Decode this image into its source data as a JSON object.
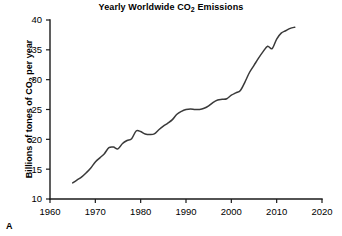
{
  "panel": {
    "label": "A"
  },
  "chart_data": {
    "type": "line",
    "title": "Yearly Worldwide CO2 Emissions",
    "title_parts": {
      "before": "Yearly Worldwide CO",
      "sub": "2",
      "after": " Emissions"
    },
    "xlabel": "",
    "ylabel": "Billions of tones of CO2 per year",
    "ylabel_parts": {
      "before": "Billions of tones of CO",
      "sub": "2",
      "after": " per year"
    },
    "xlim": [
      1960,
      2020
    ],
    "ylim": [
      10,
      40
    ],
    "xticks": [
      1960,
      1970,
      1980,
      1990,
      2000,
      2010,
      2020
    ],
    "yticks": [
      10,
      15,
      20,
      25,
      30,
      35,
      40
    ],
    "xtick_labels": [
      "1960",
      "1970",
      "1980",
      "1990",
      "2000",
      "2010",
      "2020"
    ],
    "ytick_labels": [
      "10",
      "15",
      "20",
      "25",
      "30",
      "35",
      "40"
    ],
    "grid": false,
    "legend": false,
    "line_color": "#3a3a3a",
    "series": [
      {
        "name": "Worldwide CO2 emissions",
        "x": [
          1965,
          1966,
          1967,
          1968,
          1969,
          1970,
          1971,
          1972,
          1973,
          1974,
          1975,
          1976,
          1977,
          1978,
          1979,
          1980,
          1981,
          1982,
          1983,
          1984,
          1985,
          1986,
          1987,
          1988,
          1989,
          1990,
          1991,
          1992,
          1993,
          1994,
          1995,
          1996,
          1997,
          1998,
          1999,
          2000,
          2001,
          2002,
          2003,
          2004,
          2005,
          2006,
          2007,
          2008,
          2009,
          2010,
          2011,
          2012,
          2013,
          2014
        ],
        "values": [
          12.7,
          13.2,
          13.7,
          14.4,
          15.2,
          16.2,
          16.9,
          17.6,
          18.6,
          18.7,
          18.4,
          19.3,
          19.8,
          20.1,
          21.4,
          21.3,
          20.9,
          20.8,
          20.9,
          21.6,
          22.2,
          22.7,
          23.3,
          24.2,
          24.7,
          25.0,
          25.1,
          25.0,
          25.0,
          25.2,
          25.6,
          26.2,
          26.6,
          26.7,
          26.8,
          27.4,
          27.8,
          28.2,
          29.6,
          31.2,
          32.4,
          33.6,
          34.7,
          35.6,
          35.2,
          36.8,
          37.8,
          38.2,
          38.6,
          38.8
        ]
      }
    ]
  }
}
